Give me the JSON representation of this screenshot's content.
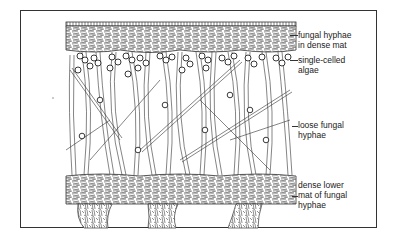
{
  "diagram": {
    "labels": [
      {
        "id": "upper-mat",
        "text": "fungal hyphae\nin dense mat"
      },
      {
        "id": "algae",
        "text": "single-celled\nalgae"
      },
      {
        "id": "loose-hyphae",
        "text": "loose fungal\nhyphae"
      },
      {
        "id": "lower-mat",
        "text": "dense lower\nmat of fungal\nhyphae"
      }
    ],
    "colors": {
      "ink": "#222222",
      "paper": "#ffffff",
      "frame": "#333333"
    }
  }
}
